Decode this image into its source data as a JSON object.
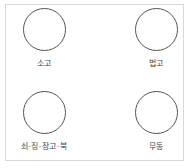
{
  "diagram": {
    "nodes": [
      {
        "label": "소고"
      },
      {
        "label": "법고"
      },
      {
        "label": "쇠·징·장고·북"
      },
      {
        "label": "무동"
      }
    ],
    "colors": {
      "circle_stroke": "#555555",
      "frame_border": "#d8d8d8",
      "text": "#444444"
    }
  }
}
